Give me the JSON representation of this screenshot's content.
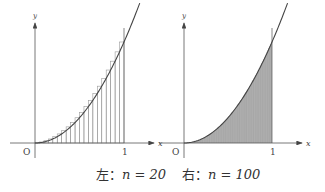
{
  "figure": {
    "left": {
      "n": 20,
      "caption_prefix": "左：",
      "caption_expr": "n = 20",
      "origin_label": "O",
      "x_label": "x",
      "y_label": "y",
      "tick_label": "1"
    },
    "right": {
      "n": 100,
      "caption_prefix": "右：",
      "caption_expr": "n = 100",
      "origin_label": "O",
      "x_label": "x",
      "y_label": "y",
      "tick_label": "1"
    },
    "colors": {
      "axis": "#555555",
      "curve": "#444444",
      "rect": "#999999",
      "fill": "#b0b0b0"
    }
  },
  "chart_data": [
    {
      "type": "bar",
      "title": "Upper Riemann sum of y = x^2 on [0,1], n = 20",
      "function": "y = x^2",
      "n": 20,
      "x": [
        0.05,
        0.1,
        0.15,
        0.2,
        0.25,
        0.3,
        0.35,
        0.4,
        0.45,
        0.5,
        0.55,
        0.6,
        0.65,
        0.7,
        0.75,
        0.8,
        0.85,
        0.9,
        0.95,
        1.0
      ],
      "values": [
        0.0025,
        0.01,
        0.0225,
        0.04,
        0.0625,
        0.09,
        0.1225,
        0.16,
        0.2025,
        0.25,
        0.3025,
        0.36,
        0.4225,
        0.49,
        0.5625,
        0.64,
        0.7225,
        0.81,
        0.9025,
        1.0
      ],
      "xlabel": "x",
      "ylabel": "y",
      "xlim": [
        0,
        1
      ],
      "grid": false
    },
    {
      "type": "area",
      "title": "Upper Riemann sum of y = x^2 on [0,1], n = 100",
      "function": "y = x^2",
      "n": 100,
      "xlabel": "x",
      "ylabel": "y",
      "xlim": [
        0,
        1
      ],
      "grid": false
    }
  ]
}
